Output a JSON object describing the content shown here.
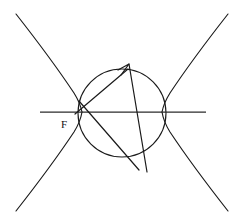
{
  "figure": {
    "background_color": "#ffffff",
    "stroke_color": "#1a1a1a",
    "width": 243,
    "height": 224,
    "labels": [
      {
        "id": "focus-label",
        "text": "F",
        "x": 61,
        "y": 128,
        "font_size": 11,
        "color": "#111111"
      }
    ],
    "elements": {
      "axis": {
        "name": "horizontal-axis-line",
        "x1": 40,
        "y1": 112,
        "x2": 206,
        "y2": 112,
        "color": "#2b2b2b"
      },
      "circle": {
        "name": "focal-circle",
        "cx": 122,
        "cy": 113,
        "r": 44,
        "color": "#1a1a1a"
      },
      "hyperbola": {
        "name": "hyperbola-curve",
        "center_x": 122,
        "center_y": 112,
        "vertex_left_x": 82,
        "vertex_right_x": 162,
        "semi_axis_a": 40,
        "semi_axis_b": 48,
        "branch_count": 2,
        "color": "#1a1a1a"
      },
      "ray_long": {
        "name": "focal-chord-ray-arrow",
        "x1": 147,
        "y1": 172,
        "x2": 128,
        "y2": 63,
        "has_arrowhead": true,
        "arrow_at": "end",
        "color": "#1a1a1a"
      },
      "ray_short": {
        "name": "secondary-chord-ray",
        "x1": 79,
        "y1": 101,
        "x2": 137,
        "y2": 167,
        "has_arrowhead": false,
        "color": "#1a1a1a"
      },
      "ray_focal": {
        "name": "focus-to-circle-segment",
        "x1": 75,
        "y1": 114,
        "x2": 126,
        "y2": 70,
        "has_arrowhead": false,
        "color": "#1a1a1a"
      }
    }
  }
}
